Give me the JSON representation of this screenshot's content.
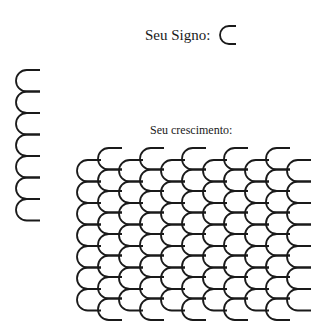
{
  "sign": {
    "label": "Seu Signo:",
    "glyph": "c-arc-icon"
  },
  "left_stack": {
    "count": 7,
    "glyph": "c-arc-icon"
  },
  "growth": {
    "label": "Seu crescimento:",
    "columns": 11,
    "low_column_rows": 8,
    "high_column_rows": 8,
    "glyph": "c-arc-icon"
  },
  "colors": {
    "stroke": "#1a1a1a",
    "background": "#ffffff"
  }
}
